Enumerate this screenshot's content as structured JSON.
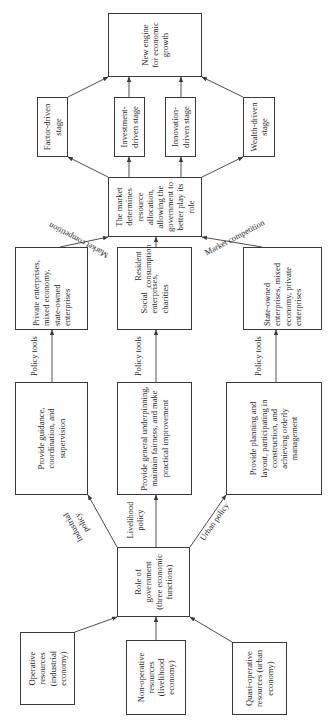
{
  "diagram": {
    "orientation": "rotated 90 degrees counterclockwise (reads bottom to top)",
    "resources": {
      "operative": "Operative resources (industrial economy)",
      "non_operative": "Non-operative resources (livelihood economy)",
      "quasi_operative": "Quasi-operative resources (urban economy)"
    },
    "government": {
      "role": "Role of government (three economic functions)"
    },
    "policies": {
      "industrial": "Industrial policy",
      "livelihood": "Livelihood policy",
      "urban": "Urban policy"
    },
    "functions": {
      "guidance": "Provide guidance, coordination, and supervision",
      "underpinning": "Provide general underpinning, maintain fairness, and make practical improvement",
      "planning": "Provide planning and layout, participating in construction, and achieving orderly management"
    },
    "policy_tools_label": "Policy tools",
    "entities": {
      "private": "Private enterprises, mixed economy, state-owned enterprises",
      "social": "Social enterprises, charities",
      "state": "State-owned enterprises, mixed economy, private enterprises"
    },
    "drivers": {
      "market_competition_left": "Market competition",
      "resident_consumption": "Resident consumption",
      "market_competition_right": "Market competition"
    },
    "market": {
      "text": "The market determines resource allocation, allowing the government to better play its role"
    },
    "stages": {
      "factor": "Factor-driven stage",
      "investment": "Investment-driven stage",
      "innovation": "Innovation-driven stage",
      "wealth": "Wealth-driven stage"
    },
    "outcome": {
      "text": "New engine for economic growth"
    }
  }
}
